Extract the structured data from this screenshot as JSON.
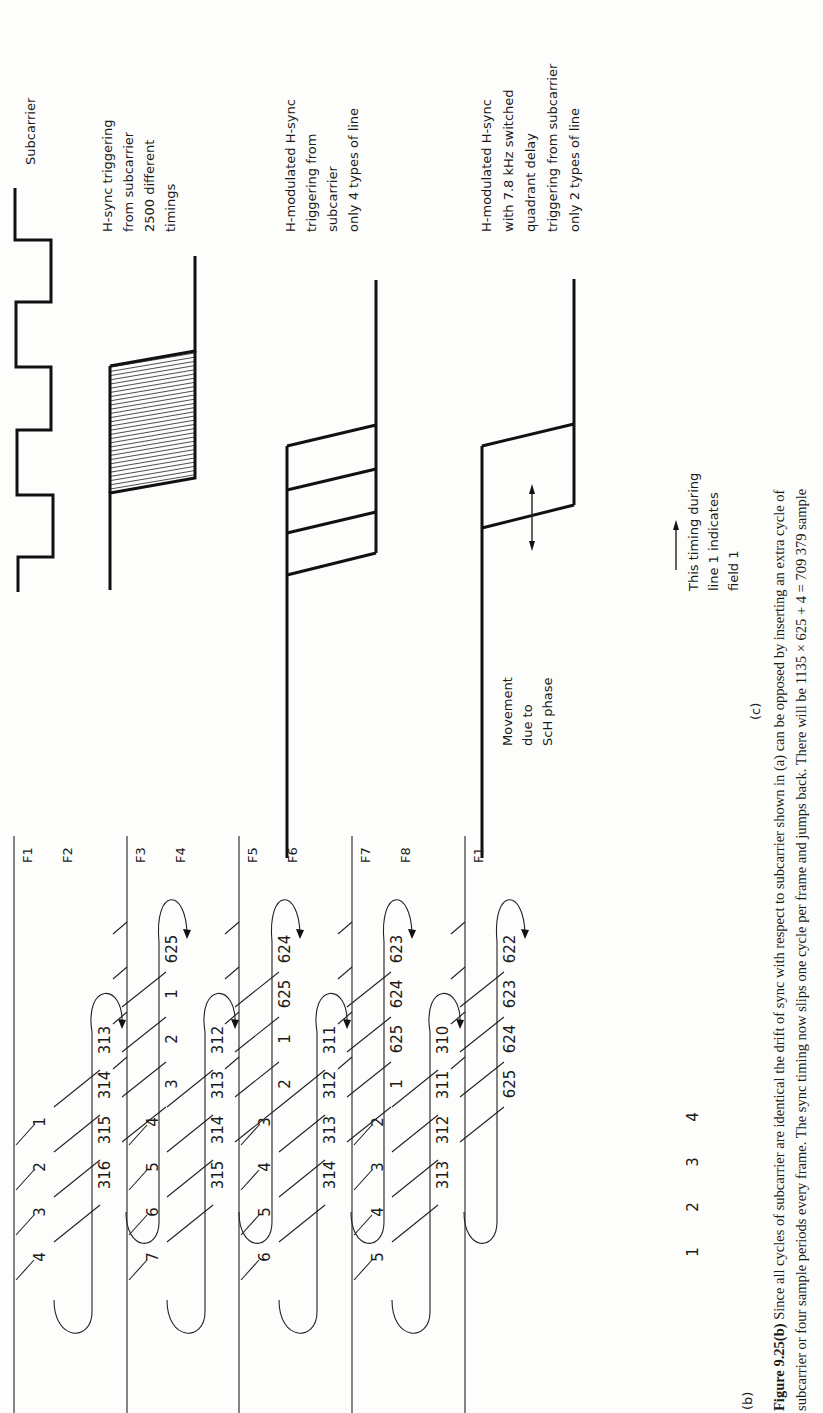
{
  "panel_c": {
    "label": "(c)",
    "waveforms": [
      {
        "id": "subcarrier",
        "label_lines": [
          "Subcarrier"
        ]
      },
      {
        "id": "hsync-triggering",
        "label_lines": [
          "H-sync triggering",
          "from subcarrier",
          "2500 different",
          "timings"
        ]
      },
      {
        "id": "h-modulated-hsync",
        "label_lines": [
          "H-modulated H-sync",
          "triggering from",
          "subcarrier",
          "only 4 types of line"
        ]
      },
      {
        "id": "h-modulated-hsync-quadrant",
        "label_lines": [
          "H-modulated H-sync",
          "with 7.8 kHz switched",
          "quadrant delay",
          "triggering from subcarrier",
          "only 2 types of line"
        ]
      }
    ],
    "movement_note": [
      "Movement",
      "due to",
      "ScH phase"
    ],
    "timing_note": [
      "This timing during",
      "line 1 indicates",
      "field 1"
    ]
  },
  "panel_b": {
    "label": "(b)",
    "fields": [
      {
        "top": "F1",
        "bottom": "F2",
        "col1": [
          "1",
          "2",
          "3",
          "4"
        ],
        "col2": [
          "313",
          "314",
          "315",
          "316"
        ],
        "col3": [
          "625",
          "1",
          "2",
          "3"
        ]
      },
      {
        "top": "F3",
        "bottom": "F4",
        "col1": [
          "4",
          "5",
          "6",
          "7"
        ],
        "col2": [
          "312",
          "313",
          "314",
          "315"
        ],
        "col3": [
          "624",
          "625",
          "1",
          "2"
        ]
      },
      {
        "top": "F5",
        "bottom": "F6",
        "col1": [
          "3",
          "4",
          "5",
          "6"
        ],
        "col2": [
          "311",
          "312",
          "313",
          "314"
        ],
        "col3": [
          "623",
          "624",
          "625",
          "1"
        ]
      },
      {
        "top": "F7",
        "bottom": "F8",
        "col1": [
          "2",
          "3",
          "4",
          "5"
        ],
        "col2": [
          "310",
          "311",
          "312",
          "313"
        ],
        "col3": [
          "622",
          "623",
          "624",
          "625"
        ]
      }
    ],
    "final_field": "F1",
    "final_row": [
      "1",
      "2",
      "3",
      "4"
    ]
  },
  "caption": {
    "figure_number": "Figure 9.25(b)",
    "line1": " Since all cycles of subcarrier are identical the drift of sync with respect to subcarrier shown in (a) can be opposed by inserting an extra cycle of",
    "line2": "subcarrier or four sample periods every frame. The sync timing now slips one cycle per frame and jumps back. There will be 1135 × 625 + 4 = 709 379 sample"
  }
}
